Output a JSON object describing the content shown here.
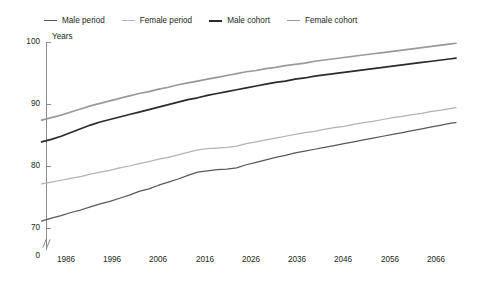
{
  "legend": {
    "position": "top",
    "items": [
      {
        "label": "Male period",
        "color": "#595959",
        "width": 1.3,
        "icon": "line-swatch-icon"
      },
      {
        "label": "Female period",
        "color": "#b3b3b3",
        "width": 1.1,
        "icon": "line-swatch-icon"
      },
      {
        "label": "Male cohort",
        "color": "#2b2b2b",
        "width": 2.0,
        "icon": "line-swatch-icon"
      },
      {
        "label": "Female cohort",
        "color": "#9a9a9a",
        "width": 1.2,
        "icon": "line-swatch-icon"
      }
    ]
  },
  "axes": {
    "ylabel": "Years",
    "yticks": [
      "0",
      "70",
      "80",
      "90",
      "100"
    ],
    "xticks": [
      "1986",
      "1996",
      "2006",
      "2016",
      "2026",
      "2036",
      "2046",
      "2056",
      "2066"
    ],
    "y_break": true,
    "ylim": [
      70,
      100
    ],
    "xlim": [
      1981,
      2068
    ]
  },
  "chart_data": {
    "type": "line",
    "title": "",
    "xlabel": "",
    "ylabel": "Years",
    "ylim": [
      70,
      100
    ],
    "xlim": [
      1981,
      2068
    ],
    "grid": false,
    "legend_position": "top",
    "axis_break": "y-axis broken between 0 and 70",
    "x": [
      1981,
      1983,
      1985,
      1987,
      1989,
      1991,
      1993,
      1995,
      1997,
      1999,
      2001,
      2003,
      2005,
      2007,
      2009,
      2011,
      2013,
      2015,
      2017,
      2019,
      2021,
      2023,
      2025,
      2027,
      2029,
      2031,
      2033,
      2035,
      2037,
      2039,
      2041,
      2043,
      2045,
      2047,
      2049,
      2051,
      2053,
      2055,
      2057,
      2059,
      2061,
      2063,
      2065,
      2066
    ],
    "series": [
      {
        "name": "Male period",
        "color": "#595959",
        "values": [
          71.1,
          71.6,
          72.0,
          72.5,
          72.9,
          73.4,
          73.9,
          74.3,
          74.8,
          75.3,
          75.9,
          76.3,
          76.9,
          77.4,
          77.9,
          78.5,
          79.0,
          79.2,
          79.4,
          79.5,
          79.7,
          80.2,
          80.6,
          81.0,
          81.4,
          81.7,
          82.1,
          82.4,
          82.7,
          83.0,
          83.3,
          83.6,
          83.9,
          84.2,
          84.5,
          84.8,
          85.1,
          85.4,
          85.7,
          86.0,
          86.3,
          86.6,
          86.9,
          87.0
        ]
      },
      {
        "name": "Female period",
        "color": "#b3b3b3",
        "values": [
          77.1,
          77.4,
          77.7,
          78.0,
          78.3,
          78.7,
          79.0,
          79.3,
          79.7,
          80.0,
          80.4,
          80.7,
          81.1,
          81.4,
          81.8,
          82.2,
          82.6,
          82.8,
          82.9,
          83.0,
          83.2,
          83.6,
          83.9,
          84.2,
          84.5,
          84.8,
          85.1,
          85.4,
          85.6,
          85.9,
          86.2,
          86.4,
          86.7,
          87.0,
          87.2,
          87.5,
          87.8,
          88.0,
          88.3,
          88.5,
          88.8,
          89.0,
          89.3,
          89.4
        ]
      },
      {
        "name": "Male cohort",
        "color": "#2b2b2b",
        "values": [
          83.9,
          84.3,
          84.8,
          85.4,
          86.0,
          86.6,
          87.1,
          87.5,
          87.9,
          88.3,
          88.7,
          89.1,
          89.5,
          89.9,
          90.3,
          90.7,
          91.0,
          91.4,
          91.7,
          92.0,
          92.3,
          92.6,
          92.9,
          93.2,
          93.5,
          93.7,
          94.0,
          94.2,
          94.5,
          94.7,
          94.9,
          95.1,
          95.3,
          95.5,
          95.7,
          95.9,
          96.1,
          96.3,
          96.5,
          96.7,
          96.9,
          97.1,
          97.3,
          97.4
        ]
      },
      {
        "name": "Female cohort",
        "color": "#9a9a9a",
        "values": [
          87.4,
          87.8,
          88.2,
          88.7,
          89.2,
          89.7,
          90.1,
          90.5,
          90.9,
          91.3,
          91.7,
          92.0,
          92.4,
          92.7,
          93.1,
          93.4,
          93.7,
          94.0,
          94.3,
          94.6,
          94.9,
          95.2,
          95.4,
          95.7,
          95.9,
          96.2,
          96.4,
          96.6,
          96.9,
          97.1,
          97.3,
          97.5,
          97.7,
          97.9,
          98.1,
          98.3,
          98.5,
          98.7,
          98.9,
          99.1,
          99.3,
          99.5,
          99.7,
          99.8
        ]
      }
    ]
  }
}
